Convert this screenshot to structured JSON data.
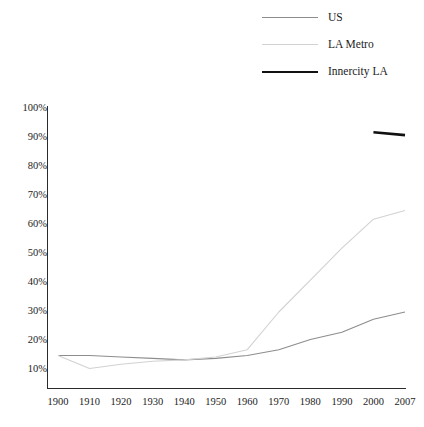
{
  "chart_data": {
    "type": "line",
    "title": "",
    "xlabel": "",
    "ylabel": "",
    "xlim": [
      1900,
      2007
    ],
    "ylim": [
      10,
      100
    ],
    "grid": false,
    "legend_position": "top-right",
    "x_tick_labels": [
      "1900",
      "1910",
      "1920",
      "1930",
      "1940",
      "1950",
      "1960",
      "1970",
      "1980",
      "1990",
      "2000",
      "2007"
    ],
    "y_tick_labels": [
      "100%",
      "90%",
      "80%",
      "70%",
      "60%",
      "50%",
      "40%",
      "30%",
      "20%",
      "10%"
    ],
    "y_tick_values": [
      100,
      90,
      80,
      70,
      60,
      50,
      40,
      30,
      20,
      10
    ],
    "series": [
      {
        "name": "US",
        "color": "#8d8d8d",
        "width": 1.1,
        "x": [
          1900,
          1910,
          1920,
          1930,
          1940,
          1950,
          1960,
          1970,
          1980,
          1990,
          2000,
          2007
        ],
        "values": [
          15,
          15,
          14.5,
          14,
          13.5,
          14,
          15,
          17,
          20.5,
          23,
          27.5,
          30
        ]
      },
      {
        "name": "LA Metro",
        "color": "#d2d2d2",
        "width": 1.1,
        "x": [
          1900,
          1910,
          1920,
          1930,
          1940,
          1950,
          1960,
          1970,
          1980,
          1990,
          2000,
          2007
        ],
        "values": [
          15,
          10.5,
          12,
          13,
          13.5,
          14.5,
          17,
          30,
          41,
          52,
          62,
          65
        ]
      },
      {
        "name": "Innercity LA",
        "color": "#111111",
        "width": 2.6,
        "x": [
          2000,
          2007
        ],
        "values": [
          92,
          91
        ]
      }
    ]
  },
  "legend": {
    "items": [
      {
        "label": "US"
      },
      {
        "label": "LA Metro"
      },
      {
        "label": "Innercity LA"
      }
    ]
  }
}
